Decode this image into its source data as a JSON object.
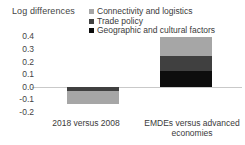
{
  "chart_data": {
    "type": "bar",
    "subtype": "stacked-bar",
    "title": "",
    "ylabel": "Log differences",
    "xlabel": "",
    "categories": [
      "2018 versus 2008",
      "EMDEs versus advanced economies"
    ],
    "series": [
      {
        "name": "Connectivity and logistics",
        "color": "#a6a6a6",
        "values": [
          -0.1,
          0.15
        ]
      },
      {
        "name": "Trade policy",
        "color": "#404040",
        "values": [
          -0.035,
          0.12
        ]
      },
      {
        "name": "Geographic and cultural factors",
        "color": "#0d0d0d",
        "values": [
          0.0,
          0.125
        ]
      }
    ],
    "totals": [
      -0.135,
      0.395
    ],
    "yticks": [
      0.4,
      0.3,
      0.2,
      0.1,
      0.0,
      -0.1,
      -0.2
    ],
    "ytick_labels": [
      "0.4",
      "0.3",
      "0.2",
      "0.1",
      "0.0",
      "-0.1",
      "-0.2"
    ],
    "ylim": [
      -0.2,
      0.45
    ],
    "grid": false,
    "legend_position": "top-right",
    "zero_line_color": "#c9c9c9"
  },
  "legend": {
    "items": [
      {
        "label": "Connectivity and logistics",
        "color": "#a6a6a6"
      },
      {
        "label": "Trade policy",
        "color": "#404040"
      },
      {
        "label": "Geographic and cultural factors",
        "color": "#0d0d0d"
      }
    ]
  },
  "axis": {
    "y_title": "Log differences",
    "y_ticks": [
      "0.4",
      "0.3",
      "0.2",
      "0.1",
      "0.0",
      "-0.1",
      "-0.2"
    ],
    "x_labels": [
      "2018 versus 2008",
      "EMDEs versus advanced economies"
    ]
  }
}
